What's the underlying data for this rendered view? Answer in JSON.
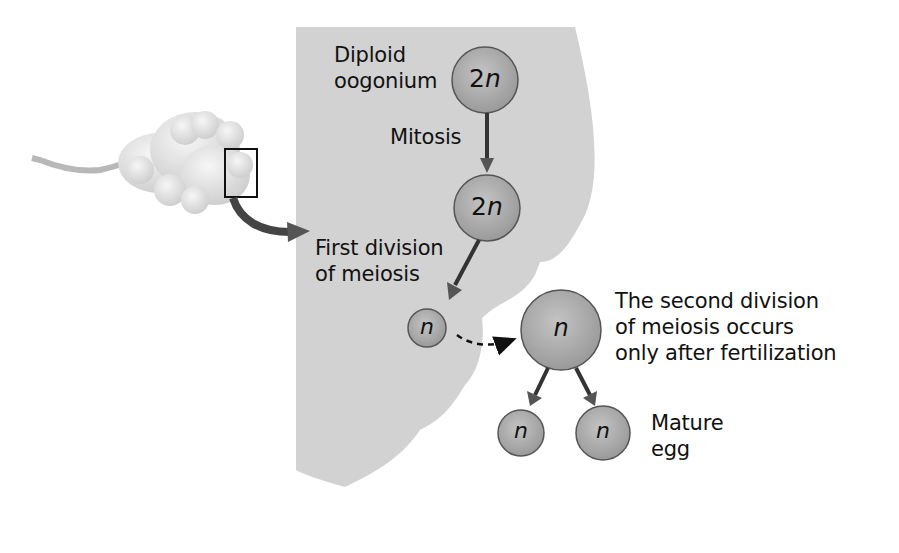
{
  "diagram": {
    "type": "oogenesis",
    "colors": {
      "background": "#ffffff",
      "ovary_tissue": "#d2d2d2",
      "cell_fill": "#a9a9a9",
      "cell_stroke": "#555555",
      "arrow": "#444444",
      "ovary_body": "#e4e4e4"
    },
    "labels": {
      "diploid_oogonium_line1": "Diploid",
      "diploid_oogonium_line2": "oogonium",
      "mitosis": "Mitosis",
      "first_division_line1": "First division",
      "first_division_line2": "of meiosis",
      "second_division_line1": "The second division",
      "second_division_line2": "of meiosis occurs",
      "second_division_line3": "only after fertilization",
      "mature_egg_line1": "Mature",
      "mature_egg_line2": "egg"
    },
    "cells": {
      "oogonium": "2n",
      "primary_oocyte": "2n",
      "secondary_oocyte": "n",
      "ovulated_oocyte": "n",
      "polar_body": "n",
      "mature_egg": "n"
    }
  }
}
